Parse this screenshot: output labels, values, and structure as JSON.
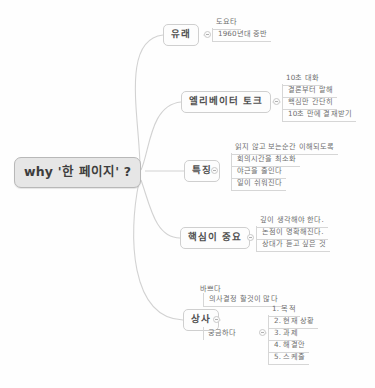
{
  "document": {
    "type": "mind-map",
    "background_color": "#fefefe",
    "root_fill": "#e6e6e6",
    "node_border": "#cfcfcf",
    "edge_color": "#d2d2d2",
    "text_color": "#6e6e6e"
  },
  "root": {
    "label": "why '한 페이지' ?"
  },
  "branches": [
    {
      "label": "유래",
      "children": [
        {
          "label": "도요타",
          "style": "underline"
        },
        {
          "label": "1960년대 중반",
          "style": "underline"
        }
      ]
    },
    {
      "label": "엘리베이터 토크",
      "children": [
        {
          "label": "10초 대화",
          "style": "underline"
        },
        {
          "label": "결론부터 말해",
          "style": "boxed"
        },
        {
          "label": "핵심만 간단히",
          "style": "boxed"
        },
        {
          "label": "10초 만에 결재받기",
          "style": "boxed"
        }
      ]
    },
    {
      "label": "특징",
      "children": [
        {
          "label": "읽지 않고 보는순간 이해되도록",
          "style": "underline"
        },
        {
          "label": "회의시간을 최소화",
          "style": "boxed"
        },
        {
          "label": "야근을 줄인다",
          "style": "boxed"
        },
        {
          "label": "일이 쉬워진다",
          "style": "boxed"
        }
      ]
    },
    {
      "label": "핵심이 중요",
      "children": [
        {
          "label": "깊이 생각해야 한다.",
          "style": "underline"
        },
        {
          "label": "논점이 명확해진다.",
          "style": "boxed"
        },
        {
          "label": "상대가 듣고 싶은 것",
          "style": "boxed"
        }
      ]
    },
    {
      "label": "상사",
      "children": [
        {
          "label": "바쁘다",
          "style": "underline"
        },
        {
          "label": "의사결정 할것이 많다",
          "style": "boxed"
        },
        {
          "label": "궁금하다",
          "style": "plain"
        }
      ],
      "numbered_list": [
        {
          "label": "1. 목적"
        },
        {
          "label": "2. 현재 상황"
        },
        {
          "label": "3. 과제"
        },
        {
          "label": "4. 해결안"
        },
        {
          "label": "5. 스케줄"
        }
      ]
    }
  ]
}
